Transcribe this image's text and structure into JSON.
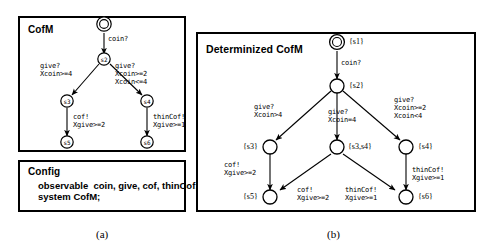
{
  "figure": {
    "captions": [
      {
        "id": "caption-a",
        "text": "(a)"
      },
      {
        "id": "caption-b",
        "text": "(b)"
      }
    ]
  },
  "panel_cofm": {
    "title": "CofM",
    "nodes": [
      {
        "id": "s1",
        "label": "s1",
        "initial": true
      },
      {
        "id": "s2",
        "label": "s2",
        "initial": false
      },
      {
        "id": "s3",
        "label": "s3",
        "initial": false
      },
      {
        "id": "s4",
        "label": "s4",
        "initial": false
      },
      {
        "id": "s5",
        "label": "s5",
        "initial": false
      },
      {
        "id": "s6",
        "label": "s6",
        "initial": false
      }
    ],
    "transitions": [
      {
        "from": "s1",
        "to": "s2",
        "label": "coin?"
      },
      {
        "from": "s2",
        "to": "s3",
        "label": "give?\nXcoin>=4"
      },
      {
        "from": "s2",
        "to": "s4",
        "label": "give?\nXcoin>=2\nXcoin<=4"
      },
      {
        "from": "s3",
        "to": "s5",
        "label": "cof!\nXgive>=2"
      },
      {
        "from": "s4",
        "to": "s6",
        "label": "thinCof!\nXgive>=1"
      }
    ]
  },
  "panel_config": {
    "title": "Config",
    "body": "observable  coin, give, cof, thinCof;\nsystem CofM;"
  },
  "panel_determinized": {
    "title": "Determinized CofM",
    "nodes": [
      {
        "id": "d1",
        "label": "{s1}",
        "initial": true
      },
      {
        "id": "d2",
        "label": "{s2}",
        "initial": false
      },
      {
        "id": "d3",
        "label": "{s3}",
        "initial": false
      },
      {
        "id": "d34",
        "label": "{s3,s4}",
        "initial": false
      },
      {
        "id": "d4",
        "label": "{s4}",
        "initial": false
      },
      {
        "id": "d5",
        "label": "{s5}",
        "initial": false
      },
      {
        "id": "d6",
        "label": "{s6}",
        "initial": false
      }
    ],
    "transitions": [
      {
        "from": "d1",
        "to": "d2",
        "label": "coin?"
      },
      {
        "from": "d2",
        "to": "d3",
        "label": "give?\nXcoin>4"
      },
      {
        "from": "d2",
        "to": "d34",
        "label": "give?\nXcoin=4"
      },
      {
        "from": "d2",
        "to": "d4",
        "label": "give?\nXcoin>=2\nXcoin<4"
      },
      {
        "from": "d3",
        "to": "d5",
        "label": "cof!\nXgive>=2"
      },
      {
        "from": "d34",
        "to": "d5",
        "label": "cof!\nXgive>=2"
      },
      {
        "from": "d34",
        "to": "d6",
        "label": "thinCof!\nXgive>=1"
      },
      {
        "from": "d4",
        "to": "d6",
        "label": "thinCof!\nXgive>=1"
      }
    ]
  },
  "colors": {
    "stroke": "#000000",
    "background": "#ffffff"
  }
}
